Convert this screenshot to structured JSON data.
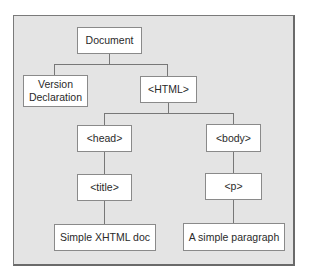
{
  "diagram": {
    "type": "tree",
    "colors": {
      "background": "#e4e4e4",
      "node_fill": "#ffffff",
      "border": "#8a8a8a",
      "edge": "#777777"
    },
    "nodes": {
      "document": {
        "label": "Document"
      },
      "version": {
        "label_line1": "Version",
        "label_line2": "Declaration"
      },
      "html": {
        "label": "<HTML>"
      },
      "head": {
        "label": "<head>"
      },
      "body": {
        "label": "<body>"
      },
      "title": {
        "label": "<title>"
      },
      "p": {
        "label": "<p>"
      },
      "title_text": {
        "label": "Simple XHTML doc"
      },
      "p_text": {
        "label": "A simple paragraph"
      }
    },
    "edges": [
      [
        "document",
        "version"
      ],
      [
        "document",
        "html"
      ],
      [
        "html",
        "head"
      ],
      [
        "html",
        "body"
      ],
      [
        "head",
        "title"
      ],
      [
        "body",
        "p"
      ],
      [
        "title",
        "title_text"
      ],
      [
        "p",
        "p_text"
      ]
    ]
  }
}
